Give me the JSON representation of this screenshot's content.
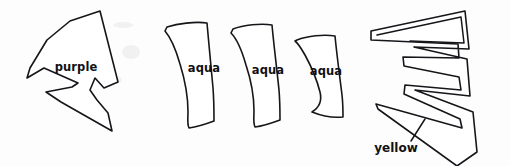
{
  "diagram": {
    "background_color": "#fdfdfd",
    "ink_color": "#16161a",
    "width": 511,
    "height": 166,
    "pieces": [
      {
        "id": "purple-piece",
        "label": "purple",
        "label_x": 76,
        "label_y": 67,
        "shape": "notched-fan",
        "outline_kind": "single",
        "path": "M 100 11 L 118 82 L 104 88 L 95 78 L 90 90 L 97 100 L 108 113 L 112 131 L 61 102 L 46 92 L 72 87 L 78 83 L 44 68 L 27 78 L 30 68 L 47 40 L 70 21 Z"
      },
      {
        "id": "aqua-piece-1",
        "label": "aqua",
        "label_x": 204,
        "label_y": 68,
        "shape": "curved-wedge",
        "outline_kind": "single",
        "path": "M 167 27 C 177 24 195 21 207 23 C 209 45 211 68 213 88 C 214 101 214 112 214 121 C 206 124 196 127 189 128 C 187 124 188 118 188 112 C 188 98 185 80 180 64 C 176 50 171 38 165 31 Z"
      },
      {
        "id": "aqua-piece-2",
        "label": "aqua",
        "label_x": 268,
        "label_y": 70,
        "shape": "curved-wedge",
        "outline_kind": "single",
        "path": "M 233 29 C 243 25 261 23 272 25 C 274 47 277 70 279 90 C 280 102 280 112 280 120 C 272 123 263 126 255 127 C 253 123 254 117 254 111 C 254 97 251 80 246 65 C 242 51 238 40 231 33 Z"
      },
      {
        "id": "aqua-piece-3",
        "label": "aqua",
        "label_x": 326,
        "label_y": 71,
        "shape": "curved-wedge",
        "outline_kind": "single",
        "path": "M 297 40 C 307 36 324 34 335 36 C 337 57 340 78 342 95 C 343 104 343 111 343 117 C 334 118 322 116 312 112 C 320 107 322 100 320 92 C 317 80 311 66 305 55 C 301 48 298 43 295 41 Z"
      },
      {
        "id": "yellow-piece",
        "label": "yellow",
        "label_x": 396,
        "label_y": 148,
        "shape": "zigzag-band",
        "outline_kind": "double",
        "path_outer": "M 371 31 L 465 11 L 469 49 L 414 47 L 467 59 L 470 96 L 415 90 L 473 112 L 477 152 L 457 166 L 378 109 L 376 104 L 462 128 L 460 119 L 404 94 L 405 85 L 461 90 L 459 77 L 404 66 L 403 57 L 459 58 L 458 44 L 371 40 Z",
        "path_inner": "M 377 35 L 461 17 L 464 43 L 410 41"
      }
    ],
    "annotations": [
      {
        "id": "yellow-leader",
        "label": "yellow",
        "target": "yellow-piece",
        "line_path": "M 411 141 L 425 119"
      }
    ],
    "smudges": [
      {
        "cx": 123,
        "cy": 25,
        "rx": 10,
        "ry": 3
      },
      {
        "cx": 131,
        "cy": 52,
        "rx": 9,
        "ry": 7
      },
      {
        "cx": 115,
        "cy": 80,
        "rx": 7,
        "ry": 4
      }
    ]
  }
}
